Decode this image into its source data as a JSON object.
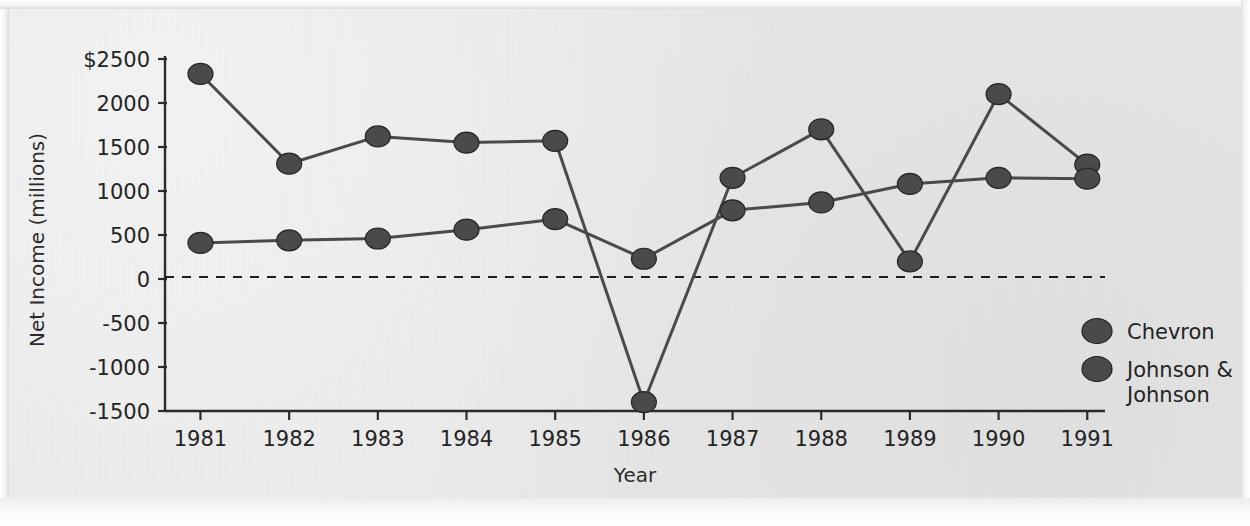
{
  "chart_data": {
    "type": "line",
    "title": "",
    "xlabel": "Year",
    "ylabel": "Net Income (millions)",
    "x": [
      1981,
      1982,
      1983,
      1984,
      1985,
      1986,
      1987,
      1988,
      1989,
      1990,
      1991
    ],
    "xtick_labels": [
      "1981",
      "1982",
      "1983",
      "1984",
      "1985",
      "1986",
      "1987",
      "1988",
      "1989",
      "1990",
      "1991"
    ],
    "ytick_labels": [
      "$2500",
      "2000",
      "1500",
      "1000",
      "500",
      "0",
      "-500",
      "-1000",
      "-1500"
    ],
    "yticks": [
      2500,
      2000,
      1500,
      1000,
      500,
      0,
      -500,
      -1000,
      -1500
    ],
    "ylim": [
      -1500,
      2500
    ],
    "xlim": [
      1980.6,
      1991.2
    ],
    "grid": false,
    "zero_line": true,
    "zero_line_style": "dashed",
    "legend_position": "right",
    "marker": "circle",
    "series": [
      {
        "name": "Chevron",
        "color": "#4a4a4a",
        "values": [
          2330,
          1310,
          1620,
          1550,
          1570,
          -1400,
          1150,
          1700,
          200,
          2100,
          1300
        ]
      },
      {
        "name": "Johnson & Johnson",
        "color": "#4a4a4a",
        "values": [
          410,
          440,
          460,
          560,
          680,
          230,
          780,
          870,
          1080,
          1150,
          1140
        ]
      }
    ]
  },
  "legend": {
    "entries": [
      {
        "label": "Chevron",
        "marker_color": "#4a4a4a"
      },
      {
        "label_line1": "Johnson &",
        "label_line2": "Johnson",
        "marker_color": "#4a4a4a"
      }
    ]
  },
  "colors": {
    "paper": "#e9e9e9",
    "ink": "#2b2b2b",
    "series": "#4a4a4a",
    "axis": "#2b2b2b"
  }
}
